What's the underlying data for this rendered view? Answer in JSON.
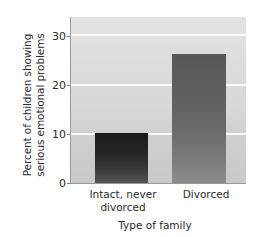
{
  "chart_data": {
    "type": "bar",
    "title": "",
    "xlabel": "Type of family",
    "ylabel": "Percent of children showing serious emotional problems",
    "categories": [
      "Intact, never divorced",
      "Divorced"
    ],
    "values": [
      10,
      26
    ],
    "ylim": [
      0,
      33.5
    ],
    "yticks": [
      0,
      10,
      20,
      30
    ],
    "ytick_labels": [
      "0",
      "10",
      "20",
      "30"
    ],
    "gridlines": [
      10,
      20,
      30
    ],
    "grid": true,
    "legend": null,
    "series": [
      {
        "name": "Percent with serious emotional problems",
        "values": [
          10,
          26
        ]
      }
    ],
    "bar_colors": [
      "#242424",
      "#6a6a6a"
    ],
    "plot_background": "#d8d8d8",
    "gridline_color": "#fbfbfb"
  },
  "axis": {
    "y_title": "Percent of children showing\nserious emotional problems",
    "y_title_line1": "Percent of children showing",
    "y_title_line2": "serious emotional problems",
    "x_title": "Type of family",
    "tick_0": "0",
    "tick_10": "10",
    "tick_20": "20",
    "tick_30": "30"
  },
  "categories": {
    "cat_0_line1": "Intact, never",
    "cat_0_line2": "divorced",
    "cat_1_line1": "Divorced"
  }
}
